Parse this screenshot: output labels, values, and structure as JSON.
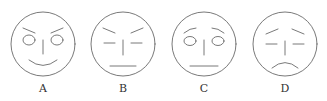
{
  "figure": {
    "stroke_color": "#6a6a6a",
    "faces": [
      {
        "label": "A",
        "cx": 43,
        "cy": 44,
        "r": 32,
        "eyes": "circles",
        "brows": "angled-down-inward",
        "mouth": "smile"
      },
      {
        "label": "B",
        "cx": 123,
        "cy": 44,
        "r": 32,
        "eyes": "lines",
        "brows": "angled-down-inward",
        "mouth": "flat"
      },
      {
        "label": "C",
        "cx": 204,
        "cy": 44,
        "r": 32,
        "eyes": "circles",
        "brows": "angled-up-inward",
        "mouth": "flat"
      },
      {
        "label": "D",
        "cx": 285,
        "cy": 44,
        "r": 32,
        "eyes": "lines",
        "brows": "angled-up-inward",
        "mouth": "frown"
      }
    ]
  }
}
